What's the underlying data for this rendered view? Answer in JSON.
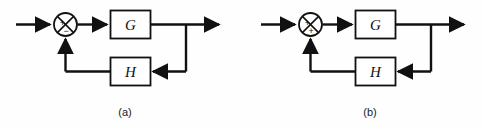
{
  "figure": {
    "background_color": "#fefefe",
    "line_color": "#111111",
    "diagrams": [
      {
        "id": "a",
        "caption": "(a)",
        "summing_junction": {
          "name": "summing-junction",
          "input_sign": "+",
          "feedback_sign": "−",
          "feedback_sign_meaning": "minus",
          "type": "negative-feedback"
        },
        "forward_block": {
          "label": "G",
          "role": "forward-path-gain"
        },
        "feedback_block": {
          "label": "H",
          "role": "feedback-path-gain"
        },
        "signals": {
          "input_arrow": "input",
          "output_arrow": "output",
          "feedback_arrow": "feedback"
        }
      },
      {
        "id": "b",
        "caption": "(b)",
        "summing_junction": {
          "name": "summing-junction",
          "input_sign": "+",
          "feedback_sign": "+",
          "feedback_sign_meaning": "plus",
          "type": "positive-feedback"
        },
        "forward_block": {
          "label": "G",
          "role": "forward-path-gain"
        },
        "feedback_block": {
          "label": "H",
          "role": "feedback-path-gain"
        },
        "signals": {
          "input_arrow": "input",
          "output_arrow": "output",
          "feedback_arrow": "feedback"
        }
      }
    ]
  }
}
